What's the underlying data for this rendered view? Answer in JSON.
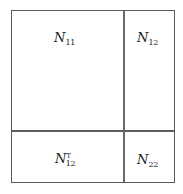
{
  "diagram": {
    "type": "block-matrix",
    "matrix_symbol": "N",
    "line_color": "#5a5a5a",
    "blocks": [
      {
        "position": "top-left",
        "base": "N",
        "subscript": "11",
        "superscript": ""
      },
      {
        "position": "top-right",
        "base": "N",
        "subscript": "12",
        "superscript": ""
      },
      {
        "position": "bottom-left",
        "base": "N",
        "subscript": "12",
        "superscript": "T"
      },
      {
        "position": "bottom-right",
        "base": "N",
        "subscript": "22",
        "superscript": ""
      }
    ]
  }
}
